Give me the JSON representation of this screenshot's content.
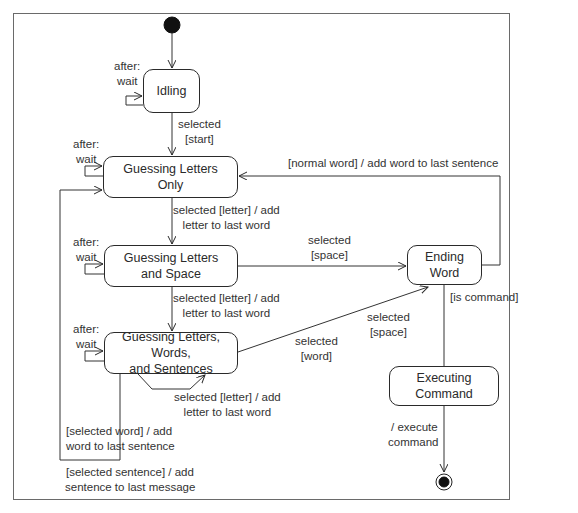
{
  "diagram": {
    "type": "UML state machine",
    "states": {
      "idling": "Idling",
      "guessing_letters_only": "Guessing Letters Only",
      "guessing_letters_space": "Guessing Letters and Space",
      "guessing_lws": "Guessing Letters, Words, and Sentences",
      "ending_word": "Ending Word",
      "executing_command": "Executing Command"
    },
    "state_lines": {
      "guessing_letters_only": [
        "Guessing Letters",
        "Only"
      ],
      "guessing_letters_space": [
        "Guessing Letters",
        "and Space"
      ],
      "guessing_lws": [
        "Guessing Letters, Words,",
        "and Sentences"
      ]
    },
    "transitions": {
      "idle_wait": [
        "after:",
        "wait"
      ],
      "idle_to_glo": [
        "selected",
        "[start]"
      ],
      "glo_wait": [
        "after:",
        "wait"
      ],
      "glo_to_gls": [
        "selected [letter] / add",
        "letter to last word"
      ],
      "gls_wait": [
        "after:",
        "wait"
      ],
      "gls_to_ew": [
        "selected",
        "[space]"
      ],
      "gls_to_glws": [
        "selected [letter] / add",
        "letter to last word"
      ],
      "glws_wait": [
        "after:",
        "wait"
      ],
      "glws_self": [
        "selected [letter] / add",
        "letter to last word"
      ],
      "glws_to_ew_space": [
        "selected",
        "[space]"
      ],
      "glws_to_ew_word": [
        "selected",
        "[word]"
      ],
      "glws_to_glo_word": [
        "[selected word] / add",
        "word to last sentence"
      ],
      "glws_to_glo_sentence": [
        "[selected sentence] / add",
        "sentence to last message"
      ],
      "ew_to_glo": "[normal word] / add word to last sentence",
      "ew_to_ec": "[is command]",
      "ec_to_final": [
        "/ execute",
        "command"
      ]
    },
    "nodes": {
      "initial": "initial-node",
      "final": "final-node"
    }
  }
}
